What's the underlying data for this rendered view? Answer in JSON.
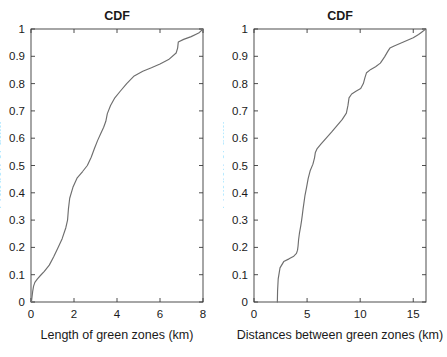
{
  "figure": {
    "width": 447,
    "height": 357,
    "background": "#ffffff",
    "line_color": "#6e6e6e",
    "axis_color": "#3a3a3a"
  },
  "chart_data": [
    {
      "type": "line",
      "panel": "left",
      "title": "CDF",
      "xlabel": "Length of green zones (km)",
      "ylabel": "Fraction of data",
      "xlim": [
        0,
        8
      ],
      "ylim": [
        0,
        1
      ],
      "xticks": [
        0,
        2,
        4,
        6,
        8
      ],
      "xticklabels": [
        "0",
        "2",
        "4",
        "6",
        "8"
      ],
      "yticks": [
        0,
        0.1,
        0.2,
        0.3,
        0.4,
        0.5,
        0.6,
        0.7,
        0.8,
        0.9,
        1
      ],
      "yticklabels": [
        "0",
        "0.1",
        "0.2",
        "0.3",
        "0.4",
        "0.5",
        "0.6",
        "0.7",
        "0.8",
        "0.9",
        "1"
      ],
      "grid": false,
      "legend": null,
      "x": [
        0.02,
        0.05,
        0.08,
        0.12,
        0.18,
        0.3,
        0.45,
        0.62,
        0.85,
        1.05,
        1.25,
        1.45,
        1.62,
        1.7,
        1.74,
        1.8,
        1.95,
        2.15,
        2.4,
        2.62,
        2.8,
        2.95,
        3.1,
        3.25,
        3.38,
        3.48,
        3.55,
        3.7,
        3.9,
        4.15,
        4.45,
        4.8,
        5.2,
        5.6,
        6.0,
        6.4,
        6.75,
        6.82,
        6.85,
        7.1,
        7.45,
        7.8,
        8.0
      ],
      "y": [
        0.0,
        0.02,
        0.04,
        0.058,
        0.072,
        0.085,
        0.098,
        0.112,
        0.135,
        0.165,
        0.198,
        0.232,
        0.272,
        0.3,
        0.34,
        0.38,
        0.42,
        0.455,
        0.478,
        0.5,
        0.53,
        0.562,
        0.592,
        0.618,
        0.64,
        0.662,
        0.69,
        0.72,
        0.748,
        0.772,
        0.8,
        0.828,
        0.845,
        0.858,
        0.872,
        0.888,
        0.912,
        0.93,
        0.952,
        0.962,
        0.972,
        0.985,
        1.0
      ]
    },
    {
      "type": "line",
      "panel": "right",
      "title": "CDF",
      "xlabel": "Distances between green zones (km)",
      "ylabel": "Fraction of data",
      "xlim": [
        0,
        16.2
      ],
      "ylim": [
        0,
        1
      ],
      "xticks": [
        0,
        5,
        10,
        15
      ],
      "xticklabels": [
        "0",
        "5",
        "10",
        "15"
      ],
      "yticks": [
        0,
        0.1,
        0.2,
        0.3,
        0.4,
        0.5,
        0.6,
        0.7,
        0.8,
        0.9,
        1
      ],
      "yticklabels": [
        "0",
        "0.1",
        "0.2",
        "0.3",
        "0.4",
        "0.5",
        "0.6",
        "0.7",
        "0.8",
        "0.9",
        "1"
      ],
      "grid": false,
      "legend": null,
      "x": [
        2.2,
        2.22,
        2.28,
        2.45,
        2.8,
        3.3,
        3.75,
        4.0,
        4.1,
        4.15,
        4.2,
        4.28,
        4.4,
        4.48,
        4.55,
        4.62,
        4.7,
        4.8,
        4.95,
        5.1,
        5.3,
        5.55,
        5.7,
        5.78,
        5.95,
        6.3,
        6.8,
        7.3,
        7.8,
        8.3,
        8.7,
        8.85,
        8.95,
        9.2,
        9.6,
        10.05,
        10.3,
        10.45,
        10.6,
        11.0,
        11.45,
        11.9,
        12.3,
        12.6,
        12.8,
        13.2,
        13.8,
        14.4,
        15.0,
        15.5,
        15.85,
        16.05,
        16.15
      ],
      "y": [
        0.0,
        0.04,
        0.085,
        0.125,
        0.148,
        0.158,
        0.168,
        0.178,
        0.19,
        0.205,
        0.228,
        0.252,
        0.278,
        0.298,
        0.318,
        0.34,
        0.362,
        0.39,
        0.42,
        0.452,
        0.482,
        0.505,
        0.528,
        0.548,
        0.562,
        0.578,
        0.6,
        0.622,
        0.645,
        0.668,
        0.692,
        0.72,
        0.748,
        0.762,
        0.772,
        0.782,
        0.8,
        0.822,
        0.84,
        0.852,
        0.862,
        0.875,
        0.898,
        0.918,
        0.93,
        0.938,
        0.948,
        0.958,
        0.968,
        0.98,
        0.99,
        0.996,
        1.0
      ]
    }
  ]
}
